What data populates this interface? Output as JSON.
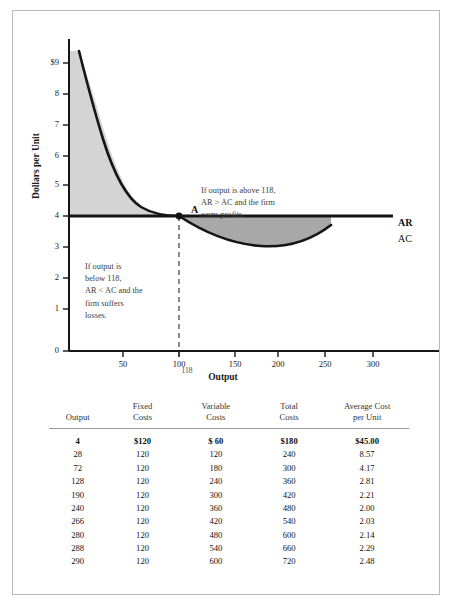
{
  "chart_data": {
    "type": "line",
    "title": "",
    "xlabel": "Output",
    "ylabel": "Dollars per Unit",
    "xlim": [
      0,
      340
    ],
    "ylim": [
      0,
      9.6
    ],
    "grid": false,
    "legend_position": "right-inline",
    "x_ticks": [
      "50",
      "100",
      "150",
      "200",
      "250",
      "300"
    ],
    "x_tick_values": [
      50,
      100,
      150,
      200,
      250,
      300
    ],
    "y_ticks": [
      "0",
      "1",
      "2",
      "3",
      "4",
      "5",
      "6",
      "7",
      "8",
      "$9"
    ],
    "y_tick_values": [
      0,
      1,
      2,
      3,
      4,
      5,
      6,
      7,
      8,
      9
    ],
    "highlight_x_tick": "118",
    "series": [
      {
        "name": "AR",
        "label": "AR",
        "type": "horizontal-line",
        "value": 3.0,
        "x": [
          0,
          340
        ],
        "values": [
          3.0,
          3.0
        ]
      },
      {
        "name": "AC",
        "label": "AC",
        "type": "curve",
        "x": [
          4,
          28,
          72,
          128,
          190,
          240,
          266,
          280,
          288,
          290
        ],
        "values": [
          45.0,
          8.57,
          4.17,
          2.81,
          2.21,
          2.0,
          2.03,
          2.14,
          2.29,
          2.48
        ]
      }
    ],
    "annotations": [
      {
        "name": "point-a",
        "label": "A",
        "x": 118,
        "y": 3.0
      },
      {
        "name": "note-above",
        "text": "If output is above 118,\nAR > AC and the firm\nearns profits."
      },
      {
        "name": "note-below",
        "text": "If output is\nbelow 118,\nAR < AC and the\nfirm suffers\nlosses."
      }
    ],
    "shaded_regions": [
      {
        "name": "loss-region",
        "color": "#d4d4d4",
        "description": "AC above AR, output below 118"
      },
      {
        "name": "profit-region",
        "color": "#a8a8a8",
        "description": "AR above AC, output above 118"
      }
    ]
  },
  "table": {
    "headers": [
      {
        "line1": "",
        "line2": "Output"
      },
      {
        "line1": "Fixed",
        "line2": "Costs"
      },
      {
        "line1": "Variable",
        "line2": "Costs"
      },
      {
        "line1": "Total",
        "line2": "Costs"
      },
      {
        "line1": "Average Cost",
        "line2": "per Unit"
      }
    ],
    "rows": [
      {
        "output": "4",
        "fixed": "$120",
        "variable": "$  60",
        "total": "$180",
        "avg": "$45.00",
        "bold": true
      },
      {
        "output": "28",
        "fixed": "120",
        "variable": "120",
        "total": "240",
        "avg": "8.57",
        "bold": false
      },
      {
        "output": "72",
        "fixed": "120",
        "variable": "180",
        "total": "300",
        "avg": "4.17",
        "bold": false
      },
      {
        "output": "128",
        "fixed": "120",
        "variable": "240",
        "total": "360",
        "avg": "2.81",
        "bold": false
      },
      {
        "output": "190",
        "fixed": "120",
        "variable": "300",
        "total": "420",
        "avg": "2.21",
        "bold": false
      },
      {
        "output": "240",
        "fixed": "120",
        "variable": "360",
        "total": "480",
        "avg": "2.00",
        "bold": false
      },
      {
        "output": "266",
        "fixed": "120",
        "variable": "420",
        "total": "540",
        "avg": "2.03",
        "bold": false
      },
      {
        "output": "280",
        "fixed": "120",
        "variable": "480",
        "total": "600",
        "avg": "2.14",
        "bold": false
      },
      {
        "output": "288",
        "fixed": "120",
        "variable": "540",
        "total": "660",
        "avg": "2.29",
        "bold": false
      },
      {
        "output": "290",
        "fixed": "120",
        "variable": "600",
        "total": "720",
        "avg": "2.48",
        "bold": false
      }
    ]
  },
  "colors": {
    "loss_shade": "#d4d4d4",
    "profit_shade": "#a8a8a8",
    "curve": "#151515",
    "axis": "#151515",
    "frame_border": "#b9b9b9"
  }
}
